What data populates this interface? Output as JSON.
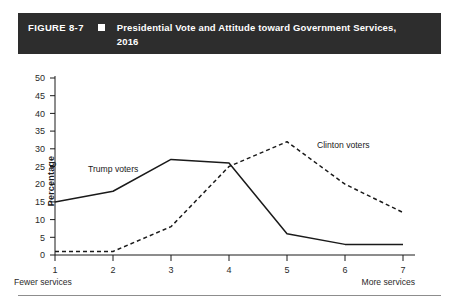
{
  "header": {
    "figure_number": "FIGURE 8-7",
    "bullet_icon": "square-bullet-icon",
    "title": "Presidential Vote and Attitude toward Government Services, 2016"
  },
  "chart_data": {
    "type": "line",
    "title": "Presidential Vote and Attitude toward Government Services, 2016",
    "xlabel": "",
    "ylabel": "Percentage",
    "x": [
      1,
      2,
      3,
      4,
      5,
      6,
      7
    ],
    "categories": [
      "1",
      "2",
      "3",
      "4",
      "5",
      "6",
      "7"
    ],
    "x_axis_low_label": "Fewer services",
    "x_axis_high_label": "More services",
    "xlim": [
      1,
      7
    ],
    "ylim": [
      0,
      50
    ],
    "y_ticks": [
      0,
      5,
      10,
      15,
      20,
      25,
      30,
      35,
      40,
      45,
      50
    ],
    "y_tick_labels": [
      "0",
      "5",
      "10",
      "15",
      "20",
      "25",
      "30",
      "35",
      "40",
      "45",
      "50"
    ],
    "grid": false,
    "legend_position": "inline-annotations",
    "series": [
      {
        "name": "Trump voters",
        "style": "solid",
        "color": "#1a1a1a",
        "values": [
          15,
          18,
          27,
          26,
          6,
          3,
          3
        ],
        "label_x": 3,
        "annotation": "Trump voters"
      },
      {
        "name": "Clinton voters",
        "style": "dashed",
        "color": "#1a1a1a",
        "values": [
          1,
          1,
          8,
          25,
          32,
          20,
          12
        ],
        "label_x": 5.8,
        "annotation": "Clinton voters"
      }
    ]
  }
}
